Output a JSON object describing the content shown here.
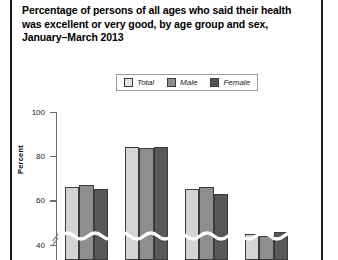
{
  "figure": {
    "title": "Percentage of persons of all ages who said their health was excellent or very good, by age group and sex, January–March 2013",
    "ylabel": "Percent"
  },
  "legend": {
    "items": [
      {
        "label": "Total",
        "color": "#e2e2e2"
      },
      {
        "label": "Male",
        "color": "#8e8e8e"
      },
      {
        "label": "Female",
        "color": "#555555"
      }
    ]
  },
  "axis": {
    "ticks": [
      "100",
      "80",
      "60",
      "40"
    ],
    "break_marker": "axis-break"
  },
  "chart_data": {
    "type": "bar",
    "title": "Percentage of persons of all ages who said their health was excellent or very good, by age group and sex, January–March 2013",
    "xlabel": "",
    "ylabel": "Percent",
    "ylim": [
      33,
      100
    ],
    "yticks": [
      40,
      60,
      80,
      100
    ],
    "grid": false,
    "legend_position": "top-center",
    "axis_break": true,
    "categories": [
      "Group 1",
      "Group 2",
      "Group 3",
      "Group 4"
    ],
    "series": [
      {
        "name": "Total",
        "color": "#d4d4d4",
        "values": [
          66.0,
          84.0,
          65.0,
          45.0
        ]
      },
      {
        "name": "Male",
        "color": "#8e8e8e",
        "values": [
          67.0,
          83.5,
          66.0,
          44.0
        ]
      },
      {
        "name": "Female",
        "color": "#585858",
        "values": [
          65.0,
          84.0,
          63.0,
          45.5
        ]
      }
    ]
  }
}
